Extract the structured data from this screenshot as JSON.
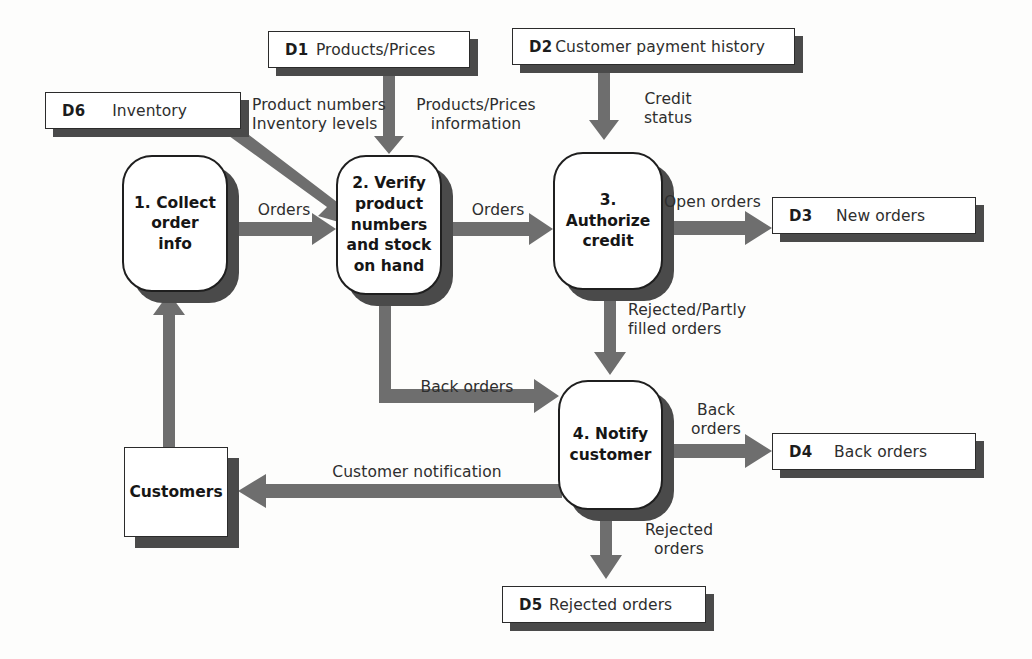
{
  "diagram": {
    "colors": {
      "arrow": "#6e6e6e",
      "shadow": "#4a4a4a",
      "outline": "#1f1f1f",
      "background": "#fdfdfc",
      "text": "#2e2e2e"
    }
  },
  "datastores": [
    {
      "id": "D1",
      "label": "Products/Prices",
      "key": "d1"
    },
    {
      "id": "D2",
      "label": "Customer payment history",
      "key": "d2"
    },
    {
      "id": "D3",
      "label": "New orders",
      "key": "d3"
    },
    {
      "id": "D4",
      "label": "Back orders",
      "key": "d4"
    },
    {
      "id": "D5",
      "label": "Rejected orders",
      "key": "d5"
    },
    {
      "id": "D6",
      "label": "Inventory",
      "key": "d6"
    }
  ],
  "processes": [
    {
      "number": "1",
      "label": "1. Collect\norder\ninfo",
      "key": "p1"
    },
    {
      "number": "2",
      "label": "2. Verify\nproduct\nnumbers\nand stock\non hand",
      "key": "p2"
    },
    {
      "number": "3",
      "label": "3. Authorize\ncredit",
      "key": "p3"
    },
    {
      "number": "4",
      "label": "4. Notify\ncustomer",
      "key": "p4"
    }
  ],
  "entities": [
    {
      "label": "Customers",
      "key": "customers"
    }
  ],
  "flows": [
    {
      "key": "f_orders_1_2",
      "label": "Orders",
      "from": "1. Collect order info",
      "to": "2. Verify product numbers and stock on hand"
    },
    {
      "key": "f_orders_2_3",
      "label": "Orders",
      "from": "2. Verify product numbers and stock on hand",
      "to": "3. Authorize credit"
    },
    {
      "key": "f_prodnum_inv",
      "label": "Product numbers\nInventory levels",
      "from": "D6 Inventory",
      "to": "2. Verify product numbers and stock on hand"
    },
    {
      "key": "f_prodprices",
      "label": "Products/Prices\ninformation",
      "from": "D1 Products/Prices",
      "to": "2. Verify product numbers and stock on hand"
    },
    {
      "key": "f_credit_status",
      "label": "Credit\nstatus",
      "from": "D2 Customer payment history",
      "to": "3. Authorize credit"
    },
    {
      "key": "f_open_orders",
      "label": "Open orders",
      "from": "3. Authorize credit",
      "to": "D3 New orders"
    },
    {
      "key": "f_rejected_partly",
      "label": "Rejected/Partly\nfilled orders",
      "from": "3. Authorize credit",
      "to": "4. Notify customer"
    },
    {
      "key": "f_back_orders_2_4",
      "label": "Back orders",
      "from": "2. Verify product numbers and stock on hand",
      "to": "4. Notify customer"
    },
    {
      "key": "f_back_orders_4_d4",
      "label": "Back\norders",
      "from": "4. Notify customer",
      "to": "D4 Back orders"
    },
    {
      "key": "f_rejected_orders",
      "label": "Rejected\norders",
      "from": "4. Notify customer",
      "to": "D5 Rejected orders"
    },
    {
      "key": "f_cust_notification",
      "label": "Customer notification",
      "from": "4. Notify customer",
      "to": "Customers"
    },
    {
      "key": "f_cust_to_p1",
      "label": "",
      "from": "Customers",
      "to": "1. Collect order info"
    }
  ]
}
